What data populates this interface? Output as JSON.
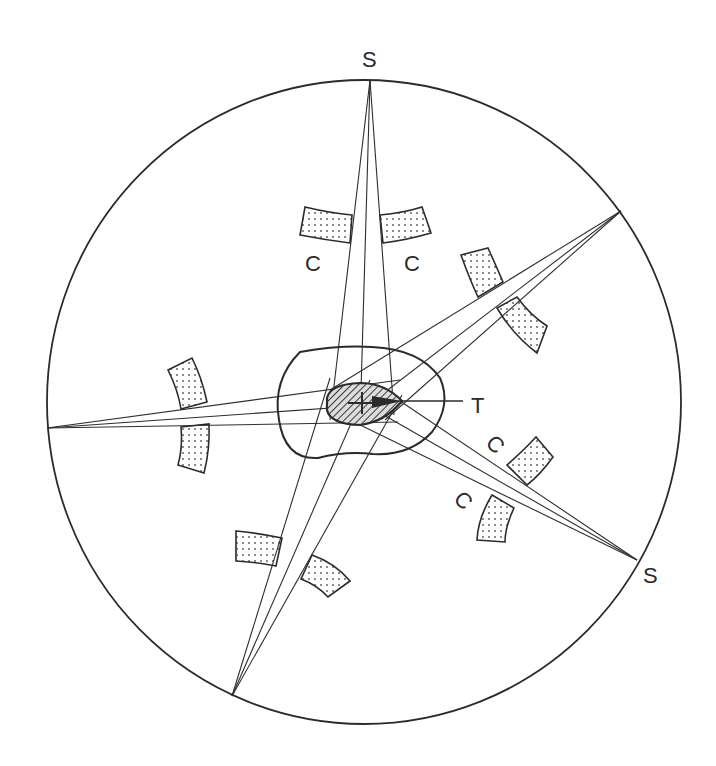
{
  "diagram": {
    "type": "multi-beam irradiation schematic (cross-section)",
    "colors": {
      "line": "#2b2b2b",
      "background": "#ffffff",
      "stipple": "#555555",
      "hatch": "#444444"
    },
    "labels": {
      "source_top": "S",
      "source_right": "S",
      "target": "T",
      "critical_upper_left": "C",
      "critical_upper_right": "C",
      "critical_right_upper": "C",
      "critical_right_lower": "C"
    },
    "elements": {
      "body_outline": "circle",
      "target_region": "hatched lens-shaped target",
      "envelope_region": "bean-shaped outer contour around target",
      "beams": 5,
      "rays_per_beam": 3,
      "shielding_blocks": 8
    }
  }
}
